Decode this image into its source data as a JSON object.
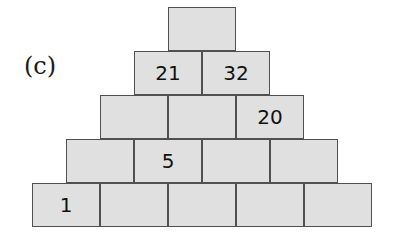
{
  "label": "(c)",
  "pyramid": {
    "rows": [
      {
        "cells": [
          ""
        ]
      },
      {
        "cells": [
          "21",
          "32"
        ]
      },
      {
        "cells": [
          "",
          "",
          "20"
        ]
      },
      {
        "cells": [
          "",
          "5",
          "",
          ""
        ]
      },
      {
        "cells": [
          "1",
          "",
          "",
          "",
          ""
        ]
      }
    ]
  },
  "colors": {
    "block_fill": "#e0e0e0",
    "block_border": "#505050",
    "text": "#111111"
  }
}
